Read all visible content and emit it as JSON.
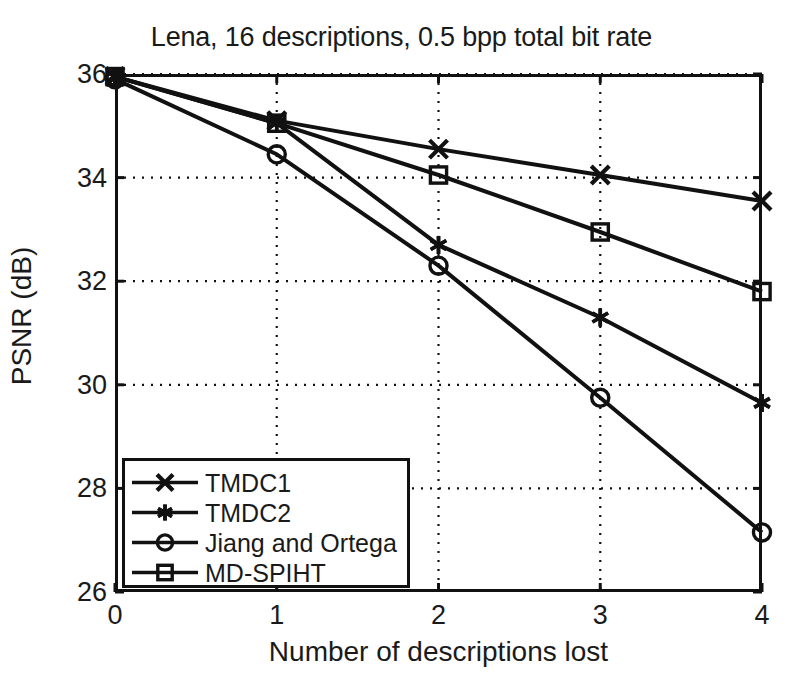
{
  "chart_data": {
    "type": "line",
    "title": "Lena, 16 descriptions, 0.5 bpp total bit rate",
    "xlabel": "Number of descriptions lost",
    "ylabel": "PSNR  (dB)",
    "x": [
      0,
      1,
      2,
      3,
      4
    ],
    "xticks": [
      "0",
      "1",
      "2",
      "3",
      "4"
    ],
    "yticks": [
      "26",
      "28",
      "30",
      "32",
      "34",
      "36"
    ],
    "xlim": [
      0,
      4
    ],
    "ylim": [
      26,
      36
    ],
    "grid": true,
    "grid_style": "dotted",
    "legend_position": "lower left",
    "line_color": "#111111",
    "series": [
      {
        "name": "TMDC1",
        "marker": "x-cross",
        "values": [
          35.95,
          35.1,
          34.55,
          34.05,
          33.55
        ]
      },
      {
        "name": "TMDC2",
        "marker": "asterisk",
        "values": [
          35.95,
          35.05,
          32.7,
          31.3,
          29.65
        ]
      },
      {
        "name": "Jiang and Ortega",
        "marker": "circle",
        "values": [
          35.9,
          34.45,
          32.3,
          29.75,
          27.15
        ]
      },
      {
        "name": "MD-SPIHT",
        "marker": "square",
        "values": [
          35.95,
          35.05,
          34.05,
          32.95,
          31.8
        ]
      }
    ]
  }
}
